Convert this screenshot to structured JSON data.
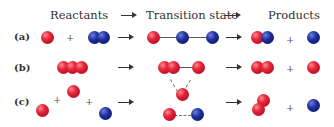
{
  "headers": {
    "reactants": "Reactants",
    "transition_state": "Transition state",
    "products": "Products"
  },
  "rows": [
    {
      "label": "(a)",
      "reactants": [
        "red",
        "+",
        "blue-blue"
      ],
      "transition_state": "red—blue—blue",
      "products": [
        "red-blue",
        "+",
        "blue"
      ]
    },
    {
      "label": "(b)",
      "reactants": [
        "red-red-red"
      ],
      "transition_state": "red-red—red",
      "products": [
        "red-red",
        "+",
        "red"
      ]
    },
    {
      "label": "(c)",
      "reactants": [
        "red",
        "+",
        "red",
        "+",
        "blue"
      ],
      "transition_state": "triangle red/red/blue",
      "products": [
        "red-red",
        "+",
        "blue"
      ]
    }
  ],
  "symbols": {
    "plus": "+"
  },
  "colors": {
    "red_atom": "#d81e34",
    "blue_atom": "#1a2a8c",
    "arrow": "#333333"
  }
}
